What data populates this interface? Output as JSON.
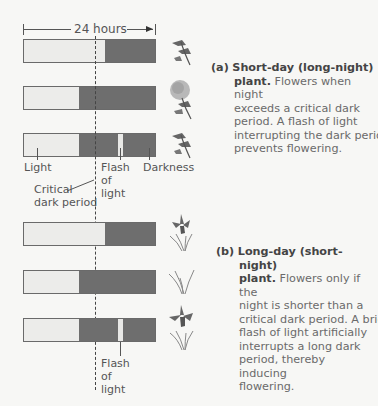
{
  "duration_label": "24 hours",
  "panels": {
    "a": {
      "tag": "(a)",
      "title": "Short-day (long-night)",
      "title_cont": "plant.",
      "text_first": "Flowers when night",
      "text_rest": [
        "exceeds a critical dark",
        "period. A flash of light",
        "interrupting the dark period",
        "prevents flowering."
      ],
      "rows": [
        {
          "light_end_pct": 62,
          "flash": false,
          "plant": "short-day-plant-no-flower"
        },
        {
          "light_end_pct": 42,
          "flash": false,
          "plant": "chrysanthemum-flowering"
        },
        {
          "light_end_pct": 42,
          "flash": true,
          "flash_start_pct": 72,
          "flash_width_pct": 3.5,
          "plant": "short-day-plant-no-flower"
        }
      ]
    },
    "b": {
      "tag": "(b)",
      "title": "Long-day (short-night)",
      "title_cont": "plant.",
      "text_first": "Flowers only if the",
      "text_rest": [
        "night is shorter than a",
        "critical dark period. A brief",
        "flash of light artificially",
        "interrupts a long dark",
        "period, thereby inducing",
        "flowering."
      ],
      "rows": [
        {
          "light_end_pct": 62,
          "flash": false,
          "plant": "iris-flowering"
        },
        {
          "light_end_pct": 42,
          "flash": false,
          "plant": "iris-leaves-no-flower"
        },
        {
          "light_end_pct": 42,
          "flash": true,
          "flash_start_pct": 72,
          "flash_width_pct": 3.5,
          "plant": "iris-flowering"
        }
      ]
    }
  },
  "labels": {
    "light": "Light",
    "darkness": "Darkness",
    "flash_line1": "Flash",
    "flash_line2": "of",
    "flash_line3": "light",
    "critical_line1": "Critical",
    "critical_line2": "dark period"
  },
  "colors": {
    "light": "#ececea",
    "dark": "#6e6e6e",
    "background": "#f7f7f5"
  }
}
